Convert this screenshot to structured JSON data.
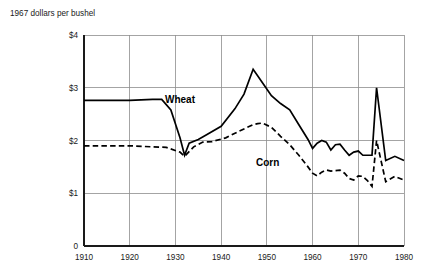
{
  "chart_data": {
    "type": "line",
    "title": "1967 dollars per bushel",
    "xlabel": "",
    "ylabel": "1967 dollars per bushel",
    "xlim": [
      1910,
      1980
    ],
    "ylim": [
      0,
      4
    ],
    "xticks": [
      "1910",
      "1920",
      "1930",
      "1940",
      "1950",
      "1960",
      "1970",
      "1980"
    ],
    "xtick_values": [
      1910,
      1920,
      1930,
      1940,
      1950,
      1960,
      1970,
      1980
    ],
    "yticks": [
      "$1",
      "$2",
      "$3",
      "$4"
    ],
    "ytick_values": [
      1,
      2,
      3,
      4
    ],
    "origin_label": "0",
    "grid": true,
    "legend_position": "inline-annotations",
    "series": [
      {
        "name": "Wheat",
        "style": "solid",
        "color": "#000000",
        "label_x": 1947,
        "label_y": 3.35,
        "label_pos": [
          165,
          103
        ],
        "points": [
          [
            1910,
            2.76
          ],
          [
            1915,
            2.76
          ],
          [
            1920,
            2.76
          ],
          [
            1925,
            2.78
          ],
          [
            1927,
            2.78
          ],
          [
            1929,
            2.58
          ],
          [
            1931,
            2.05
          ],
          [
            1932,
            1.72
          ],
          [
            1933,
            1.95
          ],
          [
            1935,
            2.02
          ],
          [
            1937,
            2.12
          ],
          [
            1940,
            2.27
          ],
          [
            1943,
            2.6
          ],
          [
            1945,
            2.88
          ],
          [
            1947,
            3.35
          ],
          [
            1949,
            3.1
          ],
          [
            1951,
            2.85
          ],
          [
            1953,
            2.7
          ],
          [
            1955,
            2.58
          ],
          [
            1957,
            2.3
          ],
          [
            1959,
            2.02
          ],
          [
            1960,
            1.85
          ],
          [
            1961,
            1.95
          ],
          [
            1962,
            2.0
          ],
          [
            1963,
            1.97
          ],
          [
            1964,
            1.82
          ],
          [
            1965,
            1.92
          ],
          [
            1966,
            1.93
          ],
          [
            1967,
            1.82
          ],
          [
            1968,
            1.72
          ],
          [
            1969,
            1.78
          ],
          [
            1970,
            1.8
          ],
          [
            1971,
            1.72
          ],
          [
            1972,
            1.72
          ],
          [
            1973,
            1.72
          ],
          [
            1974,
            3.0
          ],
          [
            1976,
            1.62
          ],
          [
            1978,
            1.7
          ],
          [
            1980,
            1.62
          ]
        ]
      },
      {
        "name": "Corn",
        "style": "dashed",
        "color": "#000000",
        "label_x": 1957,
        "label_y": 1.62,
        "label_pos": [
          256,
          166
        ],
        "points": [
          [
            1910,
            1.9
          ],
          [
            1915,
            1.9
          ],
          [
            1920,
            1.9
          ],
          [
            1925,
            1.88
          ],
          [
            1928,
            1.87
          ],
          [
            1931,
            1.78
          ],
          [
            1932,
            1.7
          ],
          [
            1934,
            1.88
          ],
          [
            1936,
            1.97
          ],
          [
            1938,
            1.98
          ],
          [
            1941,
            2.05
          ],
          [
            1944,
            2.18
          ],
          [
            1947,
            2.3
          ],
          [
            1948,
            2.32
          ],
          [
            1949,
            2.33
          ],
          [
            1951,
            2.25
          ],
          [
            1953,
            2.08
          ],
          [
            1955,
            1.92
          ],
          [
            1957,
            1.72
          ],
          [
            1959,
            1.5
          ],
          [
            1960,
            1.38
          ],
          [
            1961,
            1.33
          ],
          [
            1962,
            1.4
          ],
          [
            1963,
            1.44
          ],
          [
            1964,
            1.42
          ],
          [
            1965,
            1.43
          ],
          [
            1966,
            1.44
          ],
          [
            1967,
            1.38
          ],
          [
            1968,
            1.28
          ],
          [
            1969,
            1.25
          ],
          [
            1970,
            1.33
          ],
          [
            1971,
            1.32
          ],
          [
            1972,
            1.24
          ],
          [
            1973,
            1.13
          ],
          [
            1974,
            2.0
          ],
          [
            1976,
            1.22
          ],
          [
            1978,
            1.32
          ],
          [
            1980,
            1.25
          ]
        ]
      }
    ]
  }
}
